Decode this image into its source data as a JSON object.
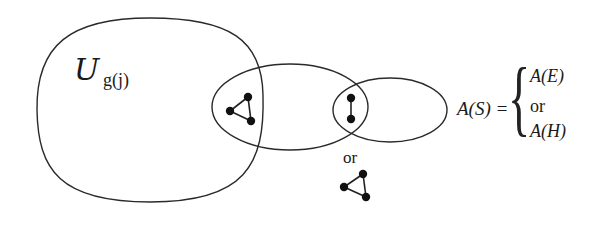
{
  "diagram": {
    "universe_label": {
      "symbol": "U",
      "subscript": "g(j)"
    },
    "sets": [
      {
        "id": "universe",
        "shape": "rounded-blob"
      },
      {
        "id": "middle-ellipse",
        "shape": "ellipse"
      },
      {
        "id": "right-ellipse",
        "shape": "ellipse"
      }
    ],
    "subgraphs": [
      {
        "id": "triangle-left",
        "type": "triangle",
        "nodes": 3,
        "edges": 3
      },
      {
        "id": "edge-middle",
        "type": "edge",
        "nodes": 2,
        "edges": 1
      },
      {
        "id": "triangle-bottom",
        "type": "triangle",
        "nodes": 3,
        "edges": 3
      }
    ],
    "or_label": "or",
    "equation": {
      "lhs": "A(S) =",
      "brace": "{",
      "cases": [
        "A(E)",
        "or",
        "A(H)"
      ]
    },
    "stroke_color": "#2a2a2a",
    "node_color": "#111111"
  }
}
